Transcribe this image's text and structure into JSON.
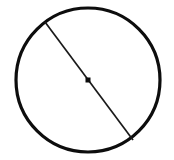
{
  "figure": {
    "type": "geometry-diagram",
    "background_color": "#ffffff",
    "width": 174,
    "height": 160,
    "shapes": {
      "circle": {
        "name": "circle-outline",
        "center_x": 88,
        "center_y": 80,
        "radius": 72,
        "stroke_color": "#0d0d0d",
        "stroke_width": 3.2,
        "fill": "none"
      },
      "diameter": {
        "name": "diameter-segment",
        "x1": 45,
        "y1": 22,
        "x2": 133,
        "y2": 140,
        "stroke_color": "#1a1a1a",
        "stroke_width": 1.7
      },
      "center_point": {
        "name": "center-dot",
        "cx": 88,
        "cy": 80,
        "size": 5,
        "fill_color": "#0d0d0d"
      }
    },
    "labels": []
  }
}
